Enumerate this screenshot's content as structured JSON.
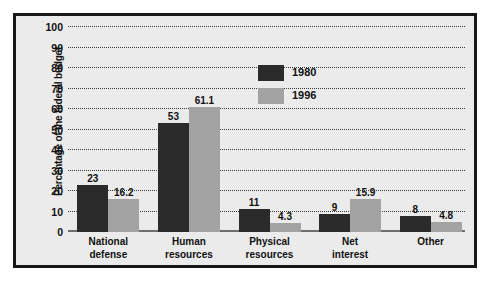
{
  "chart_data": {
    "type": "bar",
    "title": "",
    "xlabel": "",
    "ylabel": "Percentage of the federal budget",
    "ylim": [
      0,
      100
    ],
    "ytick_step": 10,
    "yticks": [
      "100",
      "90",
      "80",
      "70",
      "60",
      "50",
      "40",
      "30",
      "20",
      "10",
      "0"
    ],
    "grid": true,
    "legend_position": "inside-upper-right",
    "categories": [
      "National\ndefense",
      "Human\nresources",
      "Physical\nresources",
      "Net\ninterest",
      "Other"
    ],
    "category_lines": [
      [
        "National",
        "defense"
      ],
      [
        "Human",
        "resources"
      ],
      [
        "Physical",
        "resources"
      ],
      [
        "Net",
        "interest"
      ],
      [
        "Other",
        ""
      ]
    ],
    "series": [
      {
        "name": "1980",
        "color": "#2b2b2b",
        "values": [
          23,
          53,
          11,
          9,
          8
        ],
        "labels": [
          "23",
          "53",
          "11",
          "9",
          "8"
        ]
      },
      {
        "name": "1996",
        "color": "#a3a3a3",
        "values": [
          16.2,
          61.1,
          4.3,
          15.9,
          4.8
        ],
        "labels": [
          "16.2",
          "61.1",
          "4.3",
          "15.9",
          "4.8"
        ]
      }
    ]
  },
  "colors": {
    "frame": "#171717",
    "plot_background": "#ebebeb",
    "gridline": "#3a3a3a",
    "baseline": "#6e6e6e",
    "series_1980": "#2b2b2b",
    "series_1996": "#a3a3a3"
  }
}
